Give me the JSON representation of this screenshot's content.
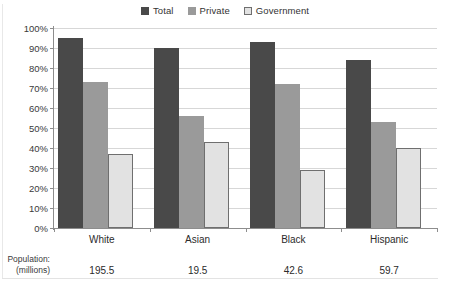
{
  "chart_data": {
    "type": "bar",
    "title": "",
    "xlabel": "",
    "ylabel": "",
    "ylim": [
      0,
      100
    ],
    "ytick_labels": [
      "100%",
      "90%",
      "80%",
      "70%",
      "60%",
      "50%",
      "40%",
      "30%",
      "20%",
      "10%",
      "0%"
    ],
    "ytick_values": [
      100,
      90,
      80,
      70,
      60,
      50,
      40,
      30,
      20,
      10,
      0
    ],
    "grid": true,
    "legend_position": "top-center",
    "categories": [
      "White",
      "Asian",
      "Black",
      "Hispanic"
    ],
    "series": [
      {
        "name": "Total",
        "color": "#494949",
        "values": [
          95,
          90,
          93,
          84
        ]
      },
      {
        "name": "Private",
        "color": "#9a9a9a",
        "values": [
          73,
          56,
          72,
          53
        ]
      },
      {
        "name": "Government",
        "color": "#e2e2e2",
        "values": [
          37,
          43,
          29,
          40
        ]
      }
    ],
    "annotations": {
      "population_caption_line1": "Population:",
      "population_caption_line2": "(millions)",
      "population_values": [
        "195.5",
        "19.5",
        "42.6",
        "59.7"
      ]
    }
  }
}
